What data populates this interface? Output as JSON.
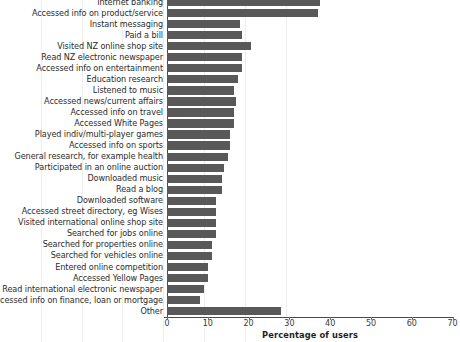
{
  "chart_data": {
    "type": "bar",
    "orientation": "horizontal",
    "title": "",
    "xlabel": "Percentage of users",
    "ylabel": "",
    "xlim": [
      0,
      70
    ],
    "xticks": [
      0,
      10,
      20,
      30,
      40,
      50,
      60,
      70
    ],
    "grid": true,
    "legend": false,
    "bar_color": "#595959",
    "categories": [
      "Internet banking",
      "Accessed info on product/service",
      "Instant messaging",
      "Paid a bill",
      "Visited NZ online shop site",
      "Read NZ electronic newspaper",
      "Accessed info on entertainment",
      "Education research",
      "Listened to music",
      "Accessed news/current affairs",
      "Accessed info on travel",
      "Accessed White Pages",
      "Played indiv/multi-player games",
      "Accessed info on sports",
      "General research, for example health",
      "Participated in an online auction",
      "Downloaded music",
      "Read a blog",
      "Downloaded software",
      "Accessed street directory, eg Wises",
      "Visited international online shop site",
      "Searched for jobs online",
      "Searched for properties online",
      "Searched for vehicles online",
      "Entered online competition",
      "Accessed Yellow Pages",
      "Read international electronic newspaper",
      "Accessed info on finance, loan or mortgage",
      "Other"
    ],
    "values": [
      37.5,
      37.0,
      18.0,
      18.5,
      20.5,
      18.5,
      18.5,
      17.5,
      16.5,
      17.0,
      16.5,
      16.5,
      15.5,
      15.5,
      15.0,
      14.0,
      13.5,
      13.5,
      12.0,
      12.0,
      12.0,
      12.0,
      11.0,
      11.0,
      10.0,
      10.0,
      9.0,
      8.0,
      28.0
    ]
  }
}
